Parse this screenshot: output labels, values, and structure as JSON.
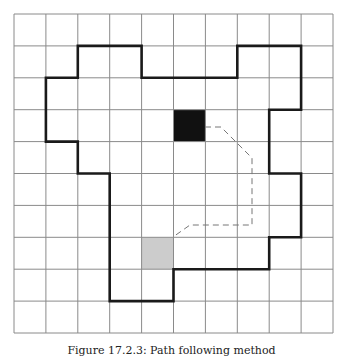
{
  "diagram": {
    "grid": {
      "cols": 10,
      "rows": 10,
      "origin_x": 14,
      "origin_y": 14,
      "cell": 31.9,
      "line_color": "#8a8a8a"
    },
    "outline": {
      "color": "#1a1a1a",
      "vertices": [
        [
          2,
          1
        ],
        [
          4,
          1
        ],
        [
          4,
          2
        ],
        [
          7,
          2
        ],
        [
          7,
          1
        ],
        [
          9,
          1
        ],
        [
          9,
          3
        ],
        [
          8,
          3
        ],
        [
          8,
          5
        ],
        [
          9,
          5
        ],
        [
          9,
          7
        ],
        [
          8,
          7
        ],
        [
          8,
          8
        ],
        [
          5,
          8
        ],
        [
          5,
          9
        ],
        [
          3,
          9
        ],
        [
          3,
          5
        ],
        [
          2,
          5
        ],
        [
          2,
          4
        ],
        [
          1,
          4
        ],
        [
          1,
          2
        ],
        [
          2,
          2
        ]
      ]
    },
    "start_cell": {
      "col": 5,
      "row": 3,
      "color": "#111111"
    },
    "goal_cell": {
      "col": 4,
      "row": 7,
      "color": "#cccccc"
    },
    "path": {
      "color": "#777777",
      "points": [
        [
          205,
          127
        ],
        [
          221,
          127
        ],
        [
          252,
          158
        ],
        [
          252,
          225
        ],
        [
          190,
          225
        ],
        [
          173,
          237
        ]
      ]
    }
  },
  "caption": "Figure 17.2.3: Path following method"
}
